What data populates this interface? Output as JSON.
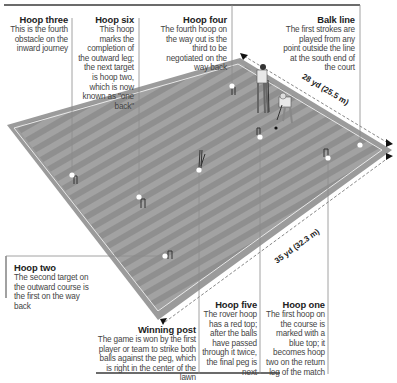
{
  "callouts": {
    "hoop_three": {
      "title": "Hoop three",
      "body": "This is the fourth obstacle on the inward journey"
    },
    "hoop_six": {
      "title": "Hoop six",
      "body": "This hoop marks the completion of the outward leg; the next target is hoop two, which is now known as \"one back\""
    },
    "hoop_four": {
      "title": "Hoop four",
      "body": "The fourth hoop on the way out is the third to be negotiated on the way back"
    },
    "balk_line": {
      "title": "Balk line",
      "body": "The first strokes are played from any point outside the line at the south end of the court"
    },
    "hoop_two": {
      "title": "Hoop two",
      "body": "The second target on the outward course is the first on the way back"
    },
    "winning_post": {
      "title": "Winning post",
      "body": "The game is won by the first player or team to strike both balls against the peg, which is right in the center of the lawn"
    },
    "hoop_five": {
      "title": "Hoop five",
      "body": "The rover hoop has a red top; after the balls have passed through it twice, the final peg is next"
    },
    "hoop_one": {
      "title": "Hoop one",
      "body": "The first hoop on the course is marked with a blue top; it becomes hoop two on the return leg of the match"
    }
  },
  "dimensions": {
    "width": "28 yd (25.5 m)",
    "length": "35 yd (32.3 m)"
  },
  "colors": {
    "lawn_dark": "#8e8e8e",
    "lawn_light": "#a3a3a3",
    "border": "#9a9a9a",
    "line": "#e6e6e6",
    "leader": "#8a8a8a",
    "rule": "#6b6b6b"
  }
}
